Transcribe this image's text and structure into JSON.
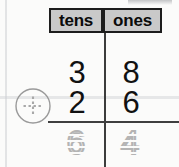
{
  "worksheet": {
    "type": "two-digit vertical addition place-value chart",
    "columns": [
      {
        "label": "tens"
      },
      {
        "label": "ones"
      }
    ],
    "operator_icon": "plus-in-circle-icon",
    "operator_symbol": "+",
    "rows": [
      {
        "name": "addend-1",
        "tens": "3",
        "ones": "8"
      },
      {
        "name": "addend-2",
        "tens": "2",
        "ones": "6"
      }
    ],
    "sum": {
      "name": "sum",
      "tens": "6",
      "ones": "4",
      "style": "dotted-trace"
    },
    "colors": {
      "paper": "#fbfbfa",
      "header_fill": "#c9c9c9",
      "header_border": "#1d1d1d",
      "ink": "#111111",
      "rule": "#3f3f3f",
      "trace_gray": "#b4b4b4"
    }
  }
}
